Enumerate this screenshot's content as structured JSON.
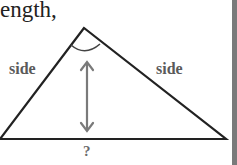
{
  "heading": {
    "text": "ength,"
  },
  "diagram": {
    "shape": "isosceles-triangle",
    "left_side_label": "side",
    "right_side_label": "side",
    "base_label": "?",
    "vertices": {
      "apex": [
        84,
        28
      ],
      "left": [
        0,
        139
      ],
      "right": [
        226,
        139
      ]
    },
    "height_arrow": {
      "x": 87,
      "y1": 62,
      "y2": 131
    },
    "apex_angle_marked": true,
    "colors": {
      "line": "#222222",
      "arrow": "#7a7a7a",
      "label": "#5a5a5a",
      "edge_bar": "#7a7a7a"
    }
  }
}
